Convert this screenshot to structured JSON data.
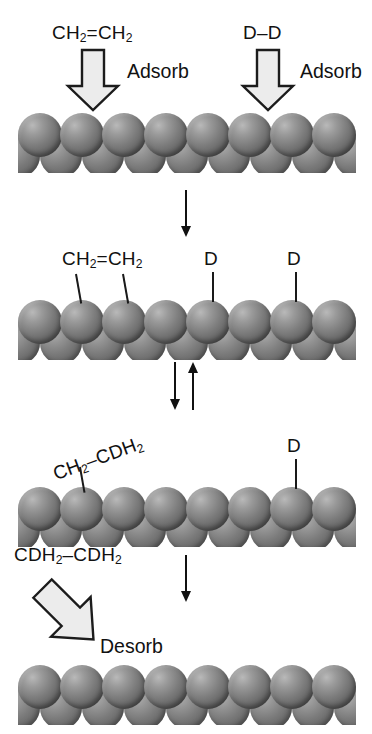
{
  "figure": {
    "background_color": "#ffffff",
    "sphere_color": "#7e7e7e",
    "arrow_fill_color": "#ececec",
    "arrow_outline_color": "#1c1c1c",
    "text_color": "#111111"
  },
  "chart_data": {
    "type": "diagram",
    "stages": [
      {
        "index": 1,
        "name": "adsorption",
        "reactants": [
          "CH2=CH2",
          "D-D"
        ],
        "process_labels": [
          "Adsorb",
          "Adsorb"
        ],
        "surface_front_spheres": 8,
        "surface_back_spheres": 9
      },
      {
        "index": 2,
        "name": "adsorbed-species",
        "adsorbates": [
          "CH2=CH2",
          "D",
          "D"
        ],
        "surface_front_spheres": 8,
        "surface_back_spheres": 9
      },
      {
        "index": 3,
        "name": "half-hydrogenated-intermediate",
        "adsorbates": [
          "CH2-CDH2",
          "D"
        ],
        "reversible": true,
        "surface_front_spheres": 8,
        "surface_back_spheres": 9
      },
      {
        "index": 4,
        "name": "desorption",
        "product": "CDH2-CDH2",
        "process_labels": [
          "Desorb"
        ],
        "surface_front_spheres": 8,
        "surface_back_spheres": 9
      }
    ],
    "transitions": [
      {
        "from": 1,
        "to": 2,
        "type": "single-down"
      },
      {
        "from": 2,
        "to": 3,
        "type": "equilibrium"
      },
      {
        "from": 3,
        "to": 4,
        "type": "single-down"
      }
    ]
  },
  "stage1": {
    "ethylene_label": {
      "pre": "CH",
      "sub1": "2",
      "mid": "=CH",
      "sub2": "2"
    },
    "deuterium_label": "D–D",
    "adsorb_left": "Adsorb",
    "adsorb_right": "Adsorb"
  },
  "stage2": {
    "ethylene_label": {
      "pre": "CH",
      "sub1": "2",
      "mid": "=CH",
      "sub2": "2"
    },
    "deuterium_left": "D",
    "deuterium_right": "D"
  },
  "stage3": {
    "intermediate_label": {
      "pre": "CH",
      "sub1": "2",
      "mid": "–CDH",
      "sub2": "2"
    },
    "deuterium_label": "D"
  },
  "stage4": {
    "product_label": {
      "pre": "CDH",
      "sub1": "2",
      "mid": "–CDH",
      "sub2": "2"
    },
    "desorb_label": "Desorb"
  }
}
